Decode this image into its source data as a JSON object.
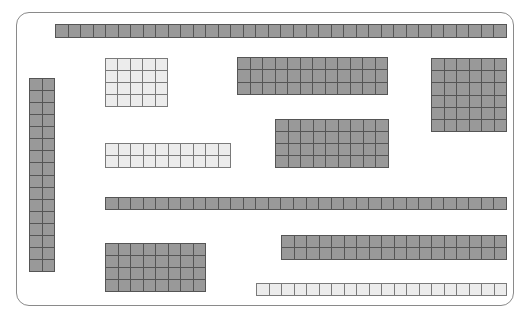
{
  "diagram": {
    "type": "grid-block-layout",
    "colors": {
      "dark_cell": "#999999",
      "light_cell": "#ececec",
      "grid_line": "#555555",
      "frame": "#8a8a8a"
    },
    "frame": {
      "x": 16,
      "y": 12,
      "width": 498,
      "height": 294,
      "radius": 13
    },
    "blocks": [
      {
        "id": "top-row",
        "x": 55,
        "y": 24,
        "cols": 36,
        "rows": 1,
        "w": 452,
        "h": 14,
        "shade": "dark"
      },
      {
        "id": "left-column",
        "x": 29,
        "y": 78,
        "cols": 2,
        "rows": 16,
        "w": 26,
        "h": 194,
        "shade": "dark"
      },
      {
        "id": "light-block-a",
        "x": 105,
        "y": 58,
        "cols": 5,
        "rows": 4,
        "w": 63,
        "h": 49,
        "shade": "light"
      },
      {
        "id": "dark-block-a",
        "x": 237,
        "y": 57,
        "cols": 12,
        "rows": 3,
        "w": 151,
        "h": 38,
        "shade": "dark"
      },
      {
        "id": "dark-block-b",
        "x": 431,
        "y": 58,
        "cols": 6,
        "rows": 6,
        "w": 76,
        "h": 74,
        "shade": "dark"
      },
      {
        "id": "dark-block-c",
        "x": 275,
        "y": 119,
        "cols": 9,
        "rows": 4,
        "w": 114,
        "h": 49,
        "shade": "dark"
      },
      {
        "id": "light-block-b",
        "x": 105,
        "y": 143,
        "cols": 10,
        "rows": 2,
        "w": 126,
        "h": 25,
        "shade": "light"
      },
      {
        "id": "middle-row",
        "x": 105,
        "y": 197,
        "cols": 32,
        "rows": 1,
        "w": 402,
        "h": 13,
        "shade": "dark"
      },
      {
        "id": "dark-block-d",
        "x": 105,
        "y": 243,
        "cols": 8,
        "rows": 4,
        "w": 101,
        "h": 49,
        "shade": "dark"
      },
      {
        "id": "dark-block-e",
        "x": 281,
        "y": 235,
        "cols": 18,
        "rows": 2,
        "w": 226,
        "h": 25,
        "shade": "dark"
      },
      {
        "id": "light-bottom-row",
        "x": 256,
        "y": 283,
        "cols": 20,
        "rows": 1,
        "w": 251,
        "h": 13,
        "shade": "light"
      }
    ]
  }
}
